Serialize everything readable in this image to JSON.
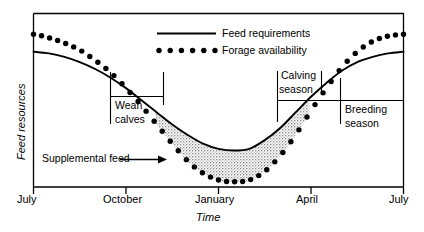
{
  "figure": {
    "background_color": "#ffffff",
    "ink_color": "#000000",
    "shade_color": "#b9b9b9"
  },
  "chart_data": {
    "type": "line",
    "title": "",
    "subtitle": "",
    "xlabel": "Time",
    "ylabel": "Feed resources",
    "grid": false,
    "legend_position": "top-center",
    "xlim": [
      0,
      12
    ],
    "ylim": [
      0,
      100
    ],
    "x_tick_labels": [
      "July",
      "October",
      "January",
      "April",
      "July"
    ],
    "x_tick_values": [
      0,
      3,
      6,
      9,
      12
    ],
    "y_tick_labels": [],
    "legend": [
      {
        "name": "Feed requirements",
        "style": "solid-line"
      },
      {
        "name": "Forage availability",
        "style": "dotted"
      }
    ],
    "series": [
      {
        "name": "Feed requirements",
        "style": "solid-line",
        "x": [
          0,
          0.5,
          1,
          1.5,
          2,
          2.5,
          3,
          3.5,
          4,
          4.5,
          5,
          5.5,
          6,
          6.5,
          7,
          7.5,
          8,
          8.5,
          9,
          9.5,
          10,
          10.5,
          11,
          11.5,
          12
        ],
        "values": [
          78,
          77,
          75,
          72,
          68,
          63,
          57,
          50,
          43,
          36,
          30,
          25,
          22,
          21,
          22,
          27,
          34,
          43,
          52,
          60,
          67,
          72,
          75,
          77,
          78
        ]
      },
      {
        "name": "Forage availability",
        "style": "dotted",
        "x": [
          0,
          0.5,
          1,
          1.5,
          2,
          2.5,
          3,
          3.5,
          4,
          4.5,
          5,
          5.5,
          6,
          6.5,
          7,
          7.5,
          8,
          8.5,
          9,
          9.5,
          10,
          10.5,
          11,
          11.5,
          12
        ],
        "values": [
          88,
          86,
          83,
          79,
          73,
          66,
          57,
          47,
          36,
          25,
          15,
          8,
          4,
          3,
          4,
          9,
          18,
          30,
          44,
          57,
          69,
          78,
          84,
          87,
          88
        ]
      }
    ],
    "annotations": [
      {
        "name": "Supplemental feed",
        "label": "Supplemental feed",
        "kind": "arrow-label",
        "points_to": "shaded-region"
      },
      {
        "name": "Wean calves",
        "label": "Wean calves",
        "kind": "bracket",
        "x_start": 2.5,
        "x_end": 4.2
      },
      {
        "name": "Calving season",
        "label": "Calving season",
        "kind": "bracket",
        "x_start": 7.9,
        "x_end": 9.35
      },
      {
        "name": "Breeding season",
        "label": "Breeding season",
        "kind": "bracket",
        "x_start": 9.9,
        "x_end": 12
      }
    ],
    "shaded_regions": [
      {
        "name": "Supplemental feed",
        "description": "Area between feed requirements and forage availability where forage is below requirements",
        "x_start": 3.95,
        "x_end": 8.95,
        "fill": "stipple-gray"
      }
    ]
  },
  "labels": {
    "y_axis_title": "Feed resources",
    "x_axis_title": "Time",
    "x_ticks": [
      "July",
      "October",
      "January",
      "April",
      "July"
    ],
    "legend_feed": "Feed requirements",
    "legend_forage": "Forage availability",
    "annot_supplemental": "Supplemental feed",
    "annot_wean_line1": "Wean",
    "annot_wean_line2": "calves",
    "annot_calving_line1": "Calving",
    "annot_calving_line2": "season",
    "annot_breeding_line1": "Breeding",
    "annot_breeding_line2": "season"
  }
}
